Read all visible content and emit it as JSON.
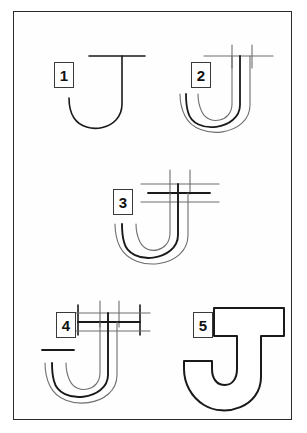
{
  "plate": {
    "title": "How to draw the letter J",
    "letter": "J",
    "total_steps": 5,
    "frame_color": "#2b2b2b",
    "background_color": "#ffffff",
    "ink_color": "#1a1a1a",
    "guide_color": "#777777"
  },
  "steps": [
    {
      "number": "1",
      "name": "step-1-skeleton",
      "description": "Basic J skeleton: horizontal top bar and curved vertical stroke"
    },
    {
      "number": "2",
      "name": "step-2-outline-curve",
      "description": "Add parallel outline around the curved stroke and second stem line"
    },
    {
      "number": "3",
      "name": "step-3-top-guides",
      "description": "Add horizontal guide lines across the top of the stem"
    },
    {
      "number": "4",
      "name": "step-4-serif-marks",
      "description": "Add serif tick marks at the ends of the top bar and the hook terminal"
    },
    {
      "number": "5",
      "name": "step-5-finished",
      "description": "Finished outlined serif letter J"
    }
  ]
}
